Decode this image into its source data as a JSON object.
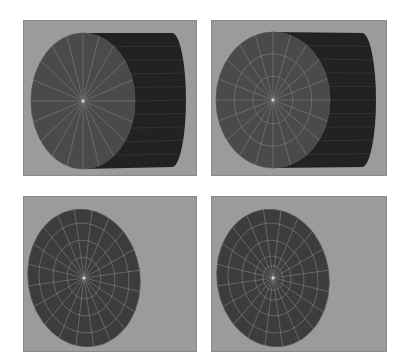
{
  "figure": {
    "colors": {
      "page_background": "#ffffff",
      "viewport_background": "#9b9b9b",
      "cap_face": "#4a4a4a",
      "cap_face_flat": "#3c3c3c",
      "side_wall": "#222222",
      "edge_lines": "#8e8e8e",
      "center_vertex": "#d8d8d8"
    },
    "panels": [
      {
        "id": "top-left",
        "x": 23,
        "y": 20,
        "w": 174,
        "h": 156,
        "show_body": true,
        "cap": {
          "cx": 82,
          "cy": 100,
          "rx": 52,
          "ry": 68,
          "rot": 0
        },
        "back": {
          "x": 185,
          "top": 32,
          "bottom": 166
        },
        "spokes": 20,
        "rings": []
      },
      {
        "id": "top-right",
        "x": 211,
        "y": 20,
        "w": 176,
        "h": 156,
        "show_body": true,
        "cap": {
          "cx": 272,
          "cy": 99,
          "rx": 57,
          "ry": 68,
          "rot": 0
        },
        "back": {
          "x": 375,
          "top": 32,
          "bottom": 166
        },
        "spokes": 20,
        "rings": [
          0.35,
          0.68
        ]
      },
      {
        "id": "bottom-left",
        "x": 23,
        "y": 196,
        "w": 174,
        "h": 156,
        "show_body": false,
        "cap": {
          "cx": 83,
          "cy": 277,
          "rx": 56,
          "ry": 69,
          "rot": -8
        },
        "spokes": 20,
        "rings": [
          0.3,
          0.55,
          0.8
        ]
      },
      {
        "id": "bottom-right",
        "x": 211,
        "y": 196,
        "w": 176,
        "h": 156,
        "show_body": false,
        "cap": {
          "cx": 272,
          "cy": 277,
          "rx": 56,
          "ry": 69,
          "rot": -8
        },
        "spokes": 20,
        "rings": [
          0.18,
          0.32,
          0.55,
          0.8
        ]
      }
    ]
  }
}
